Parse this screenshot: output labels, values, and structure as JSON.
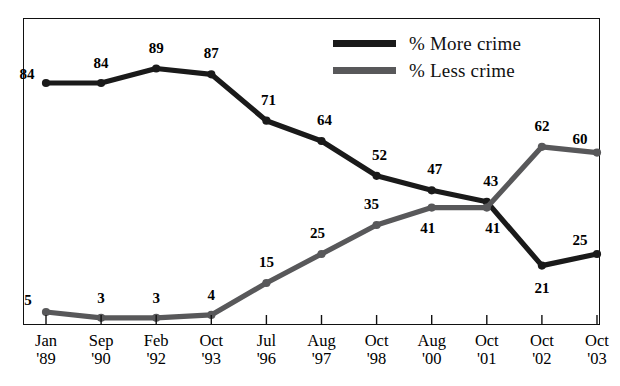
{
  "title": {
    "text": "Crime Trends in the U.S.",
    "note": "clipped-at-top"
  },
  "legend": {
    "position": "top-right",
    "items": [
      {
        "label": "% More crime",
        "color": "#1a1a1a",
        "icon": "line-swatch-icon"
      },
      {
        "label": "% Less crime",
        "color": "#58585a",
        "icon": "line-swatch-icon"
      }
    ]
  },
  "chart_data": {
    "type": "line",
    "title": "Crime Trends in the U.S.",
    "xlabel": "",
    "ylabel": "",
    "grid": false,
    "legend_position": "top-right",
    "ylim": [
      0,
      95
    ],
    "categories": [
      "Jan '89",
      "Sep '90",
      "Feb '92",
      "Oct '93",
      "Jul '96",
      "Aug '97",
      "Oct '98",
      "Aug '00",
      "Oct '01",
      "Oct '02",
      "Oct '03"
    ],
    "x_labels_line1": [
      "Jan",
      "Sep",
      "Feb",
      "Oct",
      "Jul",
      "Aug",
      "Oct",
      "Aug",
      "Oct",
      "Oct",
      "Oct"
    ],
    "x_labels_line2": [
      "'89",
      "'90",
      "'92",
      "'93",
      "'96",
      "'97",
      "'98",
      "'00",
      "'01",
      "'02",
      "'03"
    ],
    "series": [
      {
        "name": "% More crime",
        "color": "#1a1a1a",
        "values": [
          84,
          84,
          89,
          87,
          71,
          64,
          52,
          47,
          43,
          21,
          25
        ]
      },
      {
        "name": "% Less crime",
        "color": "#58585a",
        "values": [
          5,
          3,
          3,
          4,
          15,
          25,
          35,
          41,
          41,
          62,
          60
        ]
      }
    ]
  }
}
